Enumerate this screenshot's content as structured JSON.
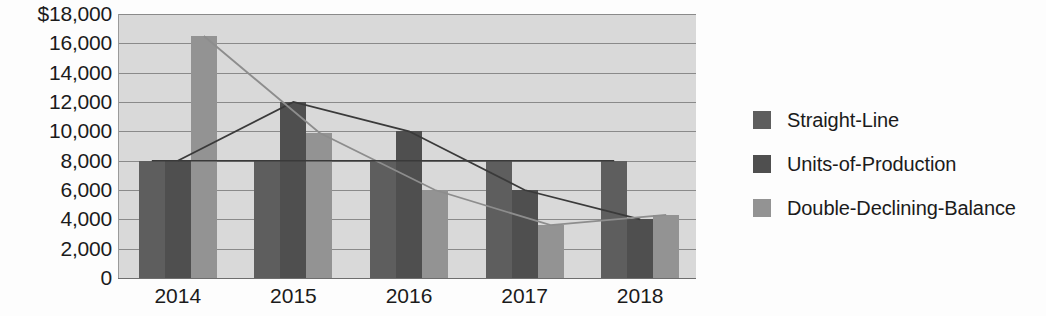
{
  "chart_data": {
    "type": "bar",
    "title": "",
    "xlabel": "",
    "ylabel": "",
    "categories": [
      "2014",
      "2015",
      "2016",
      "2017",
      "2018"
    ],
    "series": [
      {
        "name": "Straight-Line",
        "color": "#5e5e5e",
        "values": [
          8000,
          8000,
          8000,
          8000,
          8000
        ]
      },
      {
        "name": "Units-of-Production",
        "color": "#4f4f4f",
        "values": [
          8000,
          12000,
          10000,
          6000,
          4000
        ]
      },
      {
        "name": "Double-Declining-Balance",
        "color": "#939393",
        "values": [
          16500,
          9900,
          6000,
          3600,
          4300
        ]
      }
    ],
    "ylim": [
      0,
      18000
    ],
    "ytick_step": 2000,
    "ytick_labels": [
      "$18,000",
      "16,000",
      "14,000",
      "12,000",
      "10,000",
      "8,000",
      "6,000",
      "4,000",
      "2,000",
      "0"
    ],
    "ytick_values": [
      18000,
      16000,
      14000,
      12000,
      10000,
      8000,
      6000,
      4000,
      2000,
      0
    ],
    "grid": true,
    "legend_position": "right",
    "plot_background": "#d9d9d9",
    "gridline_color": "#8a8a8a",
    "overlay_lines": [
      {
        "name": "Units-of-Production",
        "color": "#3a3a3a",
        "values": [
          8000,
          12000,
          10000,
          6000,
          4000
        ]
      },
      {
        "name": "Double-Declining-Balance",
        "color": "#8d8d8d",
        "values": [
          16500,
          9900,
          6000,
          3600,
          4300
        ]
      }
    ]
  },
  "legend": {
    "items": [
      {
        "label": "Straight-Line",
        "color": "#5e5e5e"
      },
      {
        "label": "Units-of-Production",
        "color": "#4f4f4f"
      },
      {
        "label": "Double-Declining-Balance",
        "color": "#939393"
      }
    ]
  }
}
